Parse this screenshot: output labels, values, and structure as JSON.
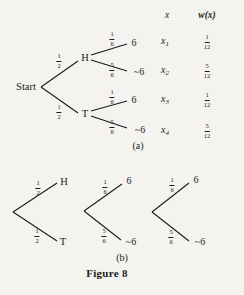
{
  "figure": {
    "caption": "Figure 8",
    "part_a_label": "(a)",
    "part_b_label": "(b)"
  },
  "tree_a": {
    "root": "Start",
    "level1": [
      {
        "prob": {
          "num": "1",
          "den": "2"
        },
        "node": "H"
      },
      {
        "prob": {
          "num": "1",
          "den": "2"
        },
        "node": "T"
      }
    ],
    "level2": [
      {
        "parent": "H",
        "prob": {
          "num": "1",
          "den": "6"
        },
        "outcome": "6"
      },
      {
        "parent": "H",
        "prob": {
          "num": "5",
          "den": "6"
        },
        "outcome": "~6"
      },
      {
        "parent": "T",
        "prob": {
          "num": "1",
          "den": "6"
        },
        "outcome": "6"
      },
      {
        "parent": "T",
        "prob": {
          "num": "5",
          "den": "6"
        },
        "outcome": "~6"
      }
    ]
  },
  "table": {
    "headers": {
      "x": "x",
      "wx": "w(x)"
    },
    "rows": [
      {
        "x_base": "x",
        "x_sub": "1",
        "w": {
          "num": "1",
          "den": "12"
        }
      },
      {
        "x_base": "x",
        "x_sub": "2",
        "w": {
          "num": "5",
          "den": "12"
        }
      },
      {
        "x_base": "x",
        "x_sub": "3",
        "w": {
          "num": "1",
          "den": "12"
        }
      },
      {
        "x_base": "x",
        "x_sub": "4",
        "w": {
          "num": "5",
          "den": "12"
        }
      }
    ]
  },
  "trees_b": [
    {
      "branches": [
        {
          "prob": {
            "num": "1",
            "den": "2"
          },
          "label": "H"
        },
        {
          "prob": {
            "num": "1",
            "den": "2"
          },
          "label": "T"
        }
      ]
    },
    {
      "branches": [
        {
          "prob": {
            "num": "1",
            "den": "6"
          },
          "label": "6"
        },
        {
          "prob": {
            "num": "5",
            "den": "6"
          },
          "label": "~6"
        }
      ]
    },
    {
      "branches": [
        {
          "prob": {
            "num": "1",
            "den": "6"
          },
          "label": "6"
        },
        {
          "prob": {
            "num": "5",
            "den": "6"
          },
          "label": "~6"
        }
      ]
    }
  ],
  "colors": {
    "paper": "#f4f3f0",
    "ink": "#1c1c1c"
  }
}
